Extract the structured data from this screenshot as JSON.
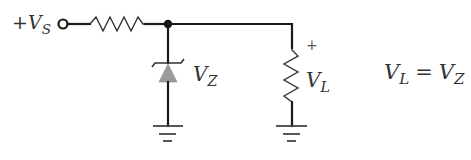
{
  "diagram": {
    "type": "zener-voltage-regulator-circuit",
    "source_label": {
      "prefix": "+",
      "symbol": "V",
      "subscript": "S"
    },
    "zener_label": {
      "symbol": "V",
      "subscript": "Z"
    },
    "load_label": {
      "polarity": "+",
      "symbol": "V",
      "subscript": "L"
    },
    "equation": {
      "lhs_symbol": "V",
      "lhs_subscript": "L",
      "operator": "=",
      "rhs_symbol": "V",
      "rhs_subscript": "Z"
    },
    "components": [
      {
        "name": "input-terminal",
        "kind": "terminal"
      },
      {
        "name": "series-resistor",
        "kind": "resistor"
      },
      {
        "name": "junction-node",
        "kind": "node"
      },
      {
        "name": "zener-diode",
        "kind": "zener-diode"
      },
      {
        "name": "load-resistor",
        "kind": "resistor"
      },
      {
        "name": "ground-zener",
        "kind": "ground"
      },
      {
        "name": "ground-load",
        "kind": "ground"
      }
    ],
    "colors": {
      "wire": "#1a1a1a",
      "diode_fill": "#9a9a9a",
      "text": "#333333",
      "background": "#ffffff"
    }
  }
}
